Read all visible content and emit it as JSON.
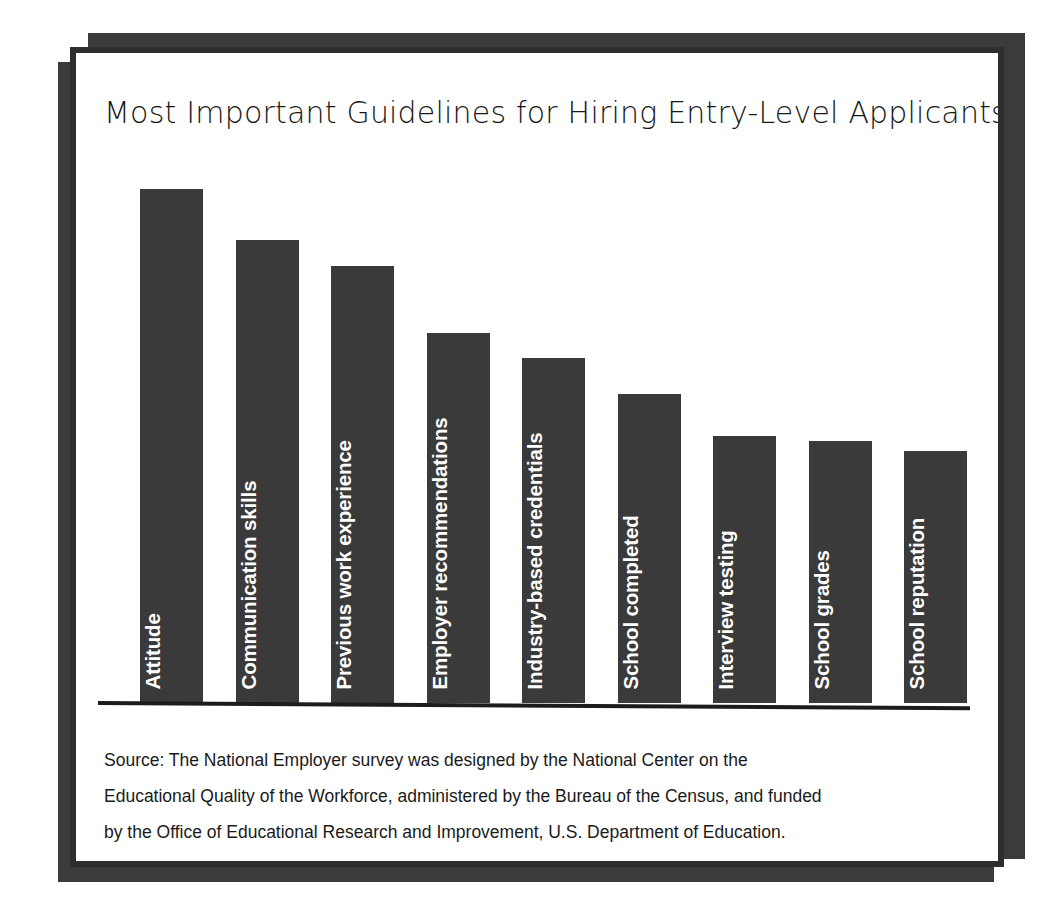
{
  "card": {
    "accent_color": "#3a3a3a",
    "border_color": "#2e2e2e",
    "background_color": "#ffffff"
  },
  "chart_data": {
    "type": "bar",
    "title": "Most Important Guidelines for Hiring Entry-Level Applicants",
    "xlabel": "",
    "ylabel": "",
    "grid": false,
    "legend": "none",
    "axis_visible": {
      "x": true,
      "y": false
    },
    "tick_labels": {
      "x": [],
      "y": []
    },
    "label_placement": "inside-bar-rotated-vertical",
    "bar_color": "#3a3a3a",
    "bar_label_color": "#ffffff",
    "categories": [
      "Attitude",
      "Communication skills",
      "Previous work experience",
      "Employer recommendations",
      "Industry-based credentials",
      "School completed",
      "Interview testing",
      "School grades",
      "School reputation"
    ],
    "values": [
      100,
      90,
      85,
      72,
      67,
      60,
      52,
      51,
      49
    ],
    "ylim": [
      0,
      105
    ]
  },
  "source": {
    "lines": [
      "Source: The National Employer survey was designed by the National Center on the",
      "Educational Quality of the Workforce, administered by the Bureau of the Census, and funded",
      "by the Office of Educational Research and Improvement, U.S. Department of Education."
    ]
  }
}
